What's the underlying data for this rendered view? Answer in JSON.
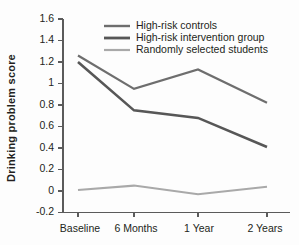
{
  "chart_data": {
    "type": "line",
    "title": "",
    "xlabel": "",
    "ylabel": "Drinking problem score",
    "categories": [
      "Baseline",
      "6 Months",
      "1 Year",
      "2 Years"
    ],
    "ylim": [
      -0.2,
      1.6
    ],
    "yticks": [
      "-0.2",
      "0",
      "0.2",
      "0.4",
      "0.6",
      "0.8",
      "1",
      "1.2",
      "1.4",
      "1.6"
    ],
    "ytick_values": [
      -0.2,
      0,
      0.2,
      0.4,
      0.6,
      0.8,
      1.0,
      1.2,
      1.4,
      1.6
    ],
    "grid": false,
    "legend_position": "top-right-inside",
    "series": [
      {
        "name": "High-risk controls",
        "color": "#6e6e6e",
        "width": 2.2,
        "values": [
          1.26,
          0.95,
          1.13,
          0.82
        ]
      },
      {
        "name": "High-risk intervention group",
        "color": "#575757",
        "width": 2.6,
        "values": [
          1.2,
          0.75,
          0.68,
          0.41
        ]
      },
      {
        "name": "Randomly selected students",
        "color": "#a9a9a9",
        "width": 2.0,
        "values": [
          0.01,
          0.05,
          -0.03,
          0.04
        ]
      }
    ]
  },
  "axis": {
    "ylabel": "Drinking problem score",
    "ytick_labels": [
      "1.6",
      "1.4",
      "1.2",
      "1",
      "0.8",
      "0.6",
      "0.4",
      "0.2",
      "0",
      "-0.2"
    ],
    "xtick_labels": [
      "Baseline",
      "6 Months",
      "1 Year",
      "2 Years"
    ]
  },
  "legend": {
    "items": [
      {
        "label": "High-risk controls",
        "color": "#6e6e6e"
      },
      {
        "label": "High-risk intervention group",
        "color": "#575757"
      },
      {
        "label": "Randomly selected students",
        "color": "#a9a9a9"
      }
    ]
  },
  "colors": {
    "axis": "#5b5b5b",
    "text": "#231f20",
    "background": "#fdfdfd",
    "controls": "#6e6e6e",
    "intervention": "#575757",
    "random": "#a9a9a9"
  }
}
